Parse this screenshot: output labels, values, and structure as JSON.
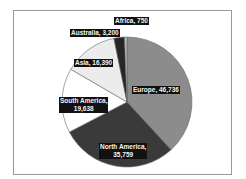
{
  "chart_data": {
    "type": "pie",
    "title": "",
    "start_angle": "12 o'clock",
    "direction": "clockwise",
    "slices": [
      {
        "label": "Europe",
        "value": 46736,
        "display": "Europe, 46,736",
        "color": "#8c8c8c"
      },
      {
        "label": "North America",
        "value": 35759,
        "display": "North America, 35,759",
        "color": "#3a3a3a"
      },
      {
        "label": "South America",
        "value": 19638,
        "display": "South America, 19,638",
        "color": "#ffffff"
      },
      {
        "label": "Asia",
        "value": 16390,
        "display": "Asia, 16,390",
        "color": "#ececec"
      },
      {
        "label": "Australia",
        "value": 3200,
        "display": "Australia, 3,200",
        "color": "#262626"
      },
      {
        "label": "Africa",
        "value": 750,
        "display": "Africa, 750",
        "color": "#bdbdbd"
      }
    ],
    "legend": "none",
    "data_labels": "category and value, dark boxes"
  },
  "labels": {
    "europe_1": "Europe, 46,736",
    "na_1": "North America,",
    "na_2": "35,759",
    "sa_1": "South America,",
    "sa_2": "19,638",
    "asia_1": "Asia, 16,390",
    "australia_1": "Australia, 3,200",
    "africa_1": "Africa, 750"
  }
}
